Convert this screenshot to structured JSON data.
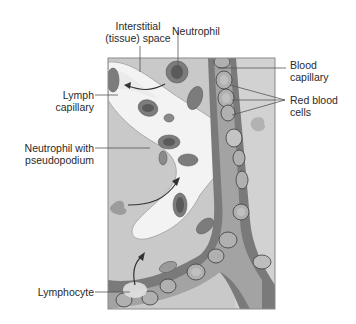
{
  "diagram": {
    "title": "",
    "labels": {
      "interstitial_line1": "Interstitial",
      "interstitial_line2": "(tissue) space",
      "neutrophil": "Neutrophil",
      "lymph_line1": "Lymph",
      "lymph_line2": "capillary",
      "neutrophil_pseudo_line1": "Neutrophil with",
      "neutrophil_pseudo_line2": "pseudopodium",
      "lymphocyte": "Lymphocyte",
      "blood_line1": "Blood",
      "blood_line2": "capillary",
      "rbc_line1": "Red blood",
      "rbc_line2": "cells"
    },
    "colors": {
      "interstitial_fill": "#c8c8c8",
      "lymph_fill": "#f4f4f4",
      "capillary_wall": "#6e6e6e",
      "capillary_lumen": "#9a9a9a",
      "cell_fill": "#7a7a7a",
      "cell_dark": "#555555",
      "rbc_fill": "#a8a8a8",
      "frame": "#888888",
      "leader_line": "#555555"
    }
  }
}
